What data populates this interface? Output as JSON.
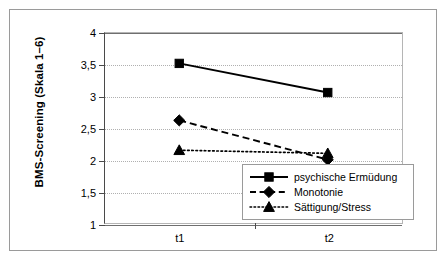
{
  "chart_data": {
    "type": "line",
    "title": "",
    "xlabel": "",
    "ylabel": "BMS-Screening (Skala 1–6)",
    "categories": [
      "t1",
      "t2"
    ],
    "ylim": [
      1,
      4
    ],
    "yticks": [
      1,
      1.5,
      2,
      2.5,
      3,
      3.5,
      4
    ],
    "ytick_labels": [
      "1",
      "1,5",
      "2",
      "2,5",
      "3",
      "3,5",
      "4"
    ],
    "grid": true,
    "legend_position": "lower-right-inside",
    "series": [
      {
        "name": "psychische Ermüdung",
        "values": [
          3.52,
          3.06
        ],
        "line_style": "solid",
        "marker": "square",
        "color": "#000000"
      },
      {
        "name": "Monotonie",
        "values": [
          2.62,
          2.0
        ],
        "line_style": "dashed",
        "marker": "diamond",
        "color": "#000000"
      },
      {
        "name": "Sättigung/Stress",
        "values": [
          2.15,
          2.1
        ],
        "line_style": "dotted",
        "marker": "triangle",
        "color": "#000000"
      }
    ]
  },
  "axes": {
    "y_title": "BMS-Screening (Skala 1–6)",
    "y_labels": [
      "4",
      "3,5",
      "3",
      "2,5",
      "2",
      "1,5",
      "1"
    ],
    "x_labels": [
      "t1",
      "t2"
    ]
  },
  "legend": {
    "items": [
      {
        "label": "psychische Ermüdung",
        "style": "solid-square"
      },
      {
        "label": "Monotonie",
        "style": "dashed-diamond"
      },
      {
        "label": "Sättigung/Stress",
        "style": "dotted-triangle"
      }
    ]
  },
  "colors": {
    "series": "#000000",
    "grid": "#b0b0b0",
    "axis": "#4a4a4a",
    "frame": "#9a9a9a",
    "background": "#ffffff"
  }
}
